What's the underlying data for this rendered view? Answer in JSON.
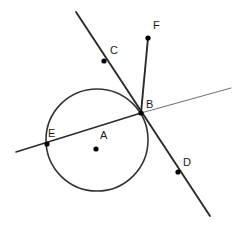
{
  "figure": {
    "width": 244,
    "height": 232,
    "background_color": "#ffffff"
  },
  "style": {
    "line_color": "#2b2b2b",
    "line_color_light": "#6e6e6e",
    "circle_color": "#333333",
    "dot_color": "#000000",
    "label_color": "#1a1a1a",
    "label_font_size": 11,
    "circle_stroke_width": 1.6,
    "line_stroke_width": 1.9,
    "secant_left_stroke_width": 1.5,
    "secant_right_stroke_width": 1.0,
    "dot_radius": 2.6
  },
  "circle": {
    "name": "circle-A",
    "center": {
      "x": 97,
      "y": 140
    },
    "radius": 51
  },
  "points": [
    {
      "id": "A",
      "label": "A",
      "role": "center",
      "dot": {
        "x": 96,
        "y": 149
      },
      "label_pos": {
        "x": 100,
        "y": 139
      },
      "has_dot": true
    },
    {
      "id": "B",
      "label": "B",
      "role": "intersection-on-circle",
      "dot": {
        "x": 141,
        "y": 113
      },
      "label_pos": {
        "x": 146,
        "y": 108
      },
      "has_dot": true
    },
    {
      "id": "C",
      "label": "C",
      "role": "point-on-line-CD",
      "dot": {
        "x": 104,
        "y": 61
      },
      "label_pos": {
        "x": 110,
        "y": 54
      },
      "has_dot": true
    },
    {
      "id": "D",
      "label": "D",
      "role": "point-on-line-CD",
      "dot": {
        "x": 178,
        "y": 172
      },
      "label_pos": {
        "x": 183,
        "y": 166
      },
      "has_dot": true
    },
    {
      "id": "E",
      "label": "E",
      "role": "point-on-circle-and-secant",
      "dot": {
        "x": 47,
        "y": 144
      },
      "label_pos": {
        "x": 48,
        "y": 137
      },
      "has_dot": true
    },
    {
      "id": "F",
      "label": "F",
      "role": "ray-endpoint",
      "dot": {
        "x": 148,
        "y": 38
      },
      "label_pos": {
        "x": 153,
        "y": 29
      },
      "has_dot": true
    }
  ],
  "lines": [
    {
      "id": "line-CD",
      "name": "line-c-d",
      "from": {
        "x": 76,
        "y": 12
      },
      "to": {
        "x": 210,
        "y": 216
      },
      "through": [
        "C",
        "B",
        "D"
      ],
      "weight": "heavy"
    },
    {
      "id": "secant-left",
      "name": "secant-e-b-left",
      "from": {
        "x": 16,
        "y": 152
      },
      "to": {
        "x": 141,
        "y": 113
      },
      "through": [
        "E",
        "B"
      ],
      "weight": "medium"
    },
    {
      "id": "secant-right",
      "name": "secant-b-right",
      "from": {
        "x": 141,
        "y": 113
      },
      "to": {
        "x": 231,
        "y": 88
      },
      "through": [
        "B"
      ],
      "weight": "light"
    },
    {
      "id": "ray-BF",
      "name": "ray-b-f",
      "from": {
        "x": 141,
        "y": 113
      },
      "to": {
        "x": 148,
        "y": 38
      },
      "through": [
        "B",
        "F"
      ],
      "weight": "heavy"
    }
  ]
}
